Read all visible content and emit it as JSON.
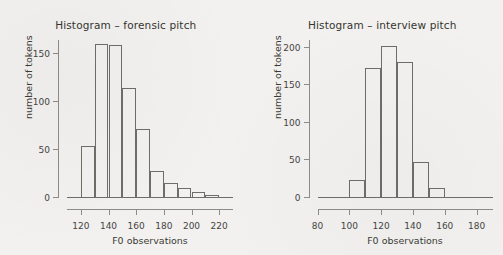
{
  "figure": {
    "background_color": "#f2f1ef",
    "axis_color": "#8d8d88",
    "bar_outline_color": "#6e6e69"
  },
  "chart_data": [
    {
      "type": "bar",
      "title": "Histogram – forensic pitch",
      "xlabel": "F0 observations",
      "ylabel": "number of tokens",
      "xlim": [
        110,
        230
      ],
      "ylim": [
        0,
        165
      ],
      "xticks": [
        120,
        140,
        160,
        180,
        200,
        220
      ],
      "yticks": [
        0,
        50,
        100,
        150
      ],
      "grid": false,
      "legend": "none",
      "bin_width": 10,
      "bin_starts": [
        110,
        120,
        130,
        140,
        150,
        160,
        170,
        180,
        190,
        200,
        210,
        220
      ],
      "categories": [
        "110-120",
        "120-130",
        "130-140",
        "140-150",
        "150-160",
        "160-170",
        "170-180",
        "180-190",
        "190-200",
        "200-210",
        "210-220",
        "220-230"
      ],
      "values": [
        1,
        54,
        161,
        160,
        115,
        72,
        28,
        16,
        10,
        6,
        3,
        1
      ]
    },
    {
      "type": "bar",
      "title": "Histogram – interview pitch",
      "xlabel": "F0 observations",
      "ylabel": "number of tokens",
      "xlim": [
        80,
        190
      ],
      "ylim": [
        0,
        210
      ],
      "xticks": [
        80,
        100,
        120,
        140,
        160,
        180
      ],
      "yticks": [
        0,
        50,
        100,
        150,
        200
      ],
      "grid": false,
      "legend": "none",
      "bin_width": 10,
      "bin_starts": [
        80,
        90,
        100,
        110,
        120,
        130,
        140,
        150,
        160,
        170,
        180
      ],
      "categories": [
        "80-90",
        "90-100",
        "100-110",
        "110-120",
        "120-130",
        "130-140",
        "140-150",
        "150-160",
        "160-170",
        "170-180",
        "180-190"
      ],
      "values": [
        1,
        1,
        24,
        173,
        202,
        181,
        48,
        13,
        1,
        1,
        1
      ]
    }
  ]
}
